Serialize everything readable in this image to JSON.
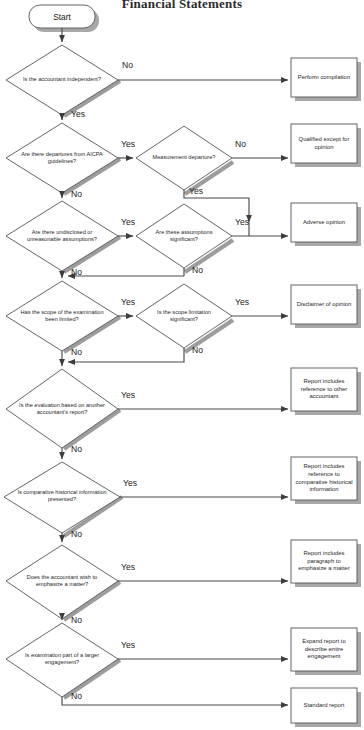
{
  "title": "Financial Statements",
  "colors": {
    "stroke": "#4a4a4a",
    "shadow": "#9a9a9a",
    "text": "#1f1f1f",
    "background": "#ffffff"
  },
  "start": {
    "label": "Start"
  },
  "decisions": [
    {
      "id": "d1",
      "label": "Is the accountant independent?",
      "yes": "Yes",
      "no": "No"
    },
    {
      "id": "d2",
      "label": "Are there departures from AICPA guidelines?",
      "yes": "Yes",
      "no": "No"
    },
    {
      "id": "d2b",
      "label": "Measurement departure?",
      "yes": "Yes",
      "no": "No"
    },
    {
      "id": "d3",
      "label": "Are there undisclosed or unreasonable assumptions?",
      "yes": "Yes",
      "no": "No"
    },
    {
      "id": "d3b",
      "label": "Are these assumptions significant?",
      "yes": "Yes",
      "no": "No"
    },
    {
      "id": "d4",
      "label": "Has the scope of the examination been limited?",
      "yes": "Yes",
      "no": "No"
    },
    {
      "id": "d4b",
      "label": "Is the scope limitation significant?",
      "yes": "Yes",
      "no": "No"
    },
    {
      "id": "d5",
      "label": "Is the evaluation based on another accountant's report?",
      "yes": "Yes",
      "no": "No"
    },
    {
      "id": "d6",
      "label": "Is comparative historical information presented?",
      "yes": "Yes",
      "no": "No"
    },
    {
      "id": "d7",
      "label": "Does the accountant wish to emphasize a matter?",
      "yes": "Yes",
      "no": "No"
    },
    {
      "id": "d8",
      "label": "Is examination part of a larger engagement?",
      "yes": "Yes",
      "no": "No"
    }
  ],
  "outcomes": [
    {
      "id": "o1",
      "label": "Perform compilation"
    },
    {
      "id": "o2",
      "label": "Qualified except for opinion"
    },
    {
      "id": "o3",
      "label": "Adverse opinion"
    },
    {
      "id": "o4",
      "label": "Disclaimer of opinion"
    },
    {
      "id": "o5",
      "label": "Report includes reference to other accountant"
    },
    {
      "id": "o6",
      "label": "Report includes reference to comparative historical information"
    },
    {
      "id": "o7",
      "label": "Report includes paragraph to emphasize a matter"
    },
    {
      "id": "o8",
      "label": "Expand report to describe entire engagement"
    },
    {
      "id": "o9",
      "label": "Standard report"
    }
  ],
  "edge_labels": {
    "e1_no": "No",
    "e1_yes": "Yes",
    "e2_yes": "Yes",
    "e2_no": "No",
    "e2b_no": "No",
    "e2b_yes": "Yes",
    "e3_yes": "Yes",
    "e3_no": "No",
    "e3b_yes": "Yes",
    "e3b_no": "No",
    "e4_yes": "Yes",
    "e4_no": "No",
    "e4b_yes": "Yes",
    "e4b_no": "No",
    "e5_yes": "Yes",
    "e5_no": "No",
    "e6_yes": "Yes",
    "e6_no": "No",
    "e7_yes": "Yes",
    "e7_no": "No",
    "e8_yes": "Yes",
    "e8_no": "No"
  }
}
